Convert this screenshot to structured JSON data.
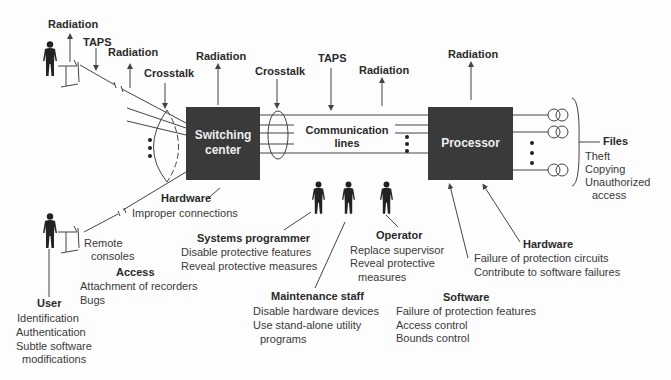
{
  "diagram": {
    "nodes": {
      "switching_center": {
        "line1": "Switching",
        "line2": "center"
      },
      "communication_lines": {
        "line1": "Communication",
        "line2": "lines"
      },
      "processor": {
        "label": "Processor"
      }
    },
    "threats_top": {
      "radiation_1": "Radiation",
      "taps_1": "TAPS",
      "radiation_2": "Radiation",
      "crosstalk_1": "Crosstalk",
      "radiation_3": "Radiation",
      "crosstalk_2": "Crosstalk",
      "taps_2": "TAPS",
      "radiation_4": "Radiation",
      "radiation_5": "Radiation"
    },
    "files": {
      "title": "Files",
      "items": [
        "Theft",
        "Copying",
        "Unauthorized",
        "access"
      ]
    },
    "switch_hardware": {
      "title": "Hardware",
      "items": [
        "Improper connections"
      ]
    },
    "remote_consoles": {
      "line1": "Remote",
      "line2": "consoles"
    },
    "access": {
      "title": "Access",
      "items": [
        "Attachment of recorders",
        "Bugs"
      ]
    },
    "user": {
      "title": "User",
      "items": [
        "Identification",
        "Authentication",
        "Subtle software",
        "modifications"
      ]
    },
    "systems_programmer": {
      "title": "Systems programmer",
      "items": [
        "Disable protective features",
        "Reveal protective measures"
      ]
    },
    "maintenance_staff": {
      "title": "Maintenance staff",
      "items": [
        "Disable hardware devices",
        "Use stand-alone utility",
        "programs"
      ]
    },
    "operator": {
      "title": "Operator",
      "items": [
        "Replace supervisor",
        "Reveal protective",
        "measures"
      ]
    },
    "software": {
      "title": "Software",
      "items": [
        "Failure of protection features",
        "Access control",
        "Bounds control"
      ]
    },
    "processor_hardware": {
      "title": "Hardware",
      "items": [
        "Failure of protection circuits",
        "Contribute to software failures"
      ]
    },
    "colors": {
      "box_fill": "#3a3a3a",
      "line": "#444444",
      "text": "#333333"
    }
  }
}
